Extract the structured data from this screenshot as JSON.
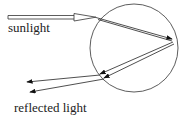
{
  "diagram": {
    "labels": {
      "sunlight": "sunlight",
      "reflected": "reflected light"
    },
    "colors": {
      "stroke": "#222222",
      "background": "#ffffff"
    },
    "shapes": {
      "droplet": {
        "type": "circle",
        "cx": 134,
        "cy": 48,
        "r": 44
      },
      "incoming_beam": {
        "type": "hollow-arrow",
        "from": [
          8,
          17
        ],
        "to": [
          97,
          17
        ]
      },
      "internal_rays": 2,
      "outgoing_rays": 2
    }
  }
}
